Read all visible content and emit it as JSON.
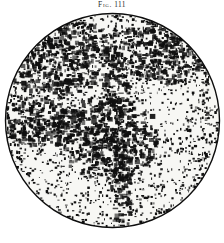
{
  "page": {
    "background_color": "#ffffff",
    "ink_color": "#101010",
    "width": 224,
    "height": 243
  },
  "caption": {
    "label": "Fig.",
    "number": "111",
    "full_text": "Fig. 111",
    "color": "#2b2b2b"
  },
  "plate": {
    "name": "circular-telescope-field",
    "shape": "circle",
    "center_x": 110,
    "center_y": 120,
    "radius": 108,
    "rim_color": "#0d0d0d",
    "field_background": "#f7f7f4",
    "description": "halftone star-cloud field"
  },
  "chart_data": {
    "type": "scatter",
    "xlabel": "",
    "ylabel": "",
    "xlim": [
      0,
      217
    ],
    "ylim": [
      0,
      221
    ],
    "grid": false,
    "legend": null,
    "regions": [
      {
        "name": "upper-left-rim-dark",
        "cx": 52,
        "cy": 46,
        "rx": 58,
        "ry": 40,
        "density": 0.86
      },
      {
        "name": "upper-right-rim-dark",
        "cx": 168,
        "cy": 40,
        "rx": 54,
        "ry": 34,
        "density": 0.8
      },
      {
        "name": "left-dark-band",
        "cx": 36,
        "cy": 110,
        "rx": 44,
        "ry": 26,
        "density": 0.9
      },
      {
        "name": "central-dark-nebula",
        "cx": 104,
        "cy": 128,
        "rx": 52,
        "ry": 42,
        "density": 0.93
      },
      {
        "name": "vertical-dust-lane-upper",
        "cx": 112,
        "cy": 70,
        "rx": 13,
        "ry": 52,
        "density": 0.78
      },
      {
        "name": "vertical-dust-lane-lower",
        "cx": 118,
        "cy": 178,
        "rx": 11,
        "ry": 48,
        "density": 0.82
      },
      {
        "name": "right-bright-patch",
        "cx": 160,
        "cy": 100,
        "rx": 36,
        "ry": 28,
        "density": 0.22
      },
      {
        "name": "lower-left-bright",
        "cx": 52,
        "cy": 176,
        "rx": 46,
        "ry": 36,
        "density": 0.26
      },
      {
        "name": "lower-right-bright",
        "cx": 168,
        "cy": 170,
        "rx": 40,
        "ry": 34,
        "density": 0.3
      },
      {
        "name": "bottom-bright-margin",
        "cx": 96,
        "cy": 206,
        "rx": 60,
        "ry": 22,
        "density": 0.28
      }
    ],
    "star_count_estimate": 4200,
    "tone_range": {
      "min": 0.12,
      "max": 0.95
    }
  }
}
